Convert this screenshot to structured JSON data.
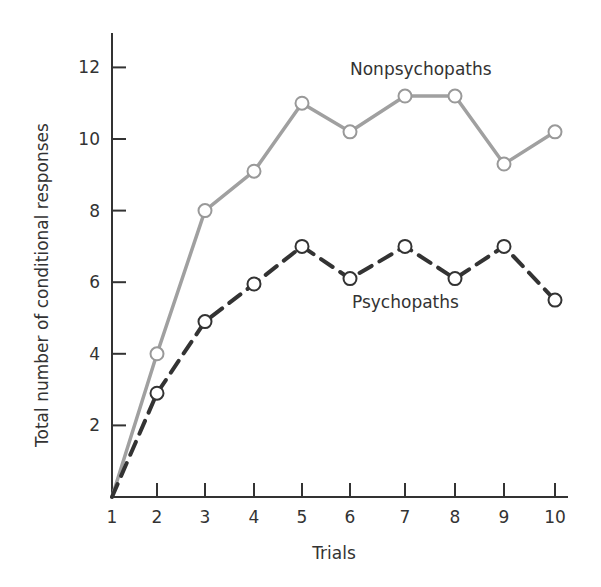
{
  "chart_data": {
    "type": "line",
    "title": "",
    "xlabel": "Trials",
    "ylabel": "Total number of conditional responses",
    "x": [
      1,
      2,
      3,
      4,
      5,
      6,
      7,
      8,
      9,
      10
    ],
    "xticks": [
      "1",
      "2",
      "3",
      "4",
      "5",
      "6",
      "7",
      "8",
      "9",
      "10"
    ],
    "yticks": [
      "2",
      "4",
      "6",
      "8",
      "10",
      "12"
    ],
    "ytick_values": [
      2,
      4,
      6,
      8,
      10,
      12
    ],
    "xlim": [
      1,
      10.3
    ],
    "ylim": [
      0,
      13
    ],
    "grid": false,
    "legend_position": "inline labels",
    "series": [
      {
        "name": "Nonpsychopaths",
        "style": "solid",
        "color": "#a0a0a0",
        "values": [
          0,
          4.0,
          8.0,
          9.1,
          11.0,
          10.2,
          11.2,
          11.2,
          9.3,
          10.2
        ]
      },
      {
        "name": "Psychopaths",
        "style": "dashed",
        "color": "#333333",
        "values": [
          0,
          2.9,
          4.9,
          5.95,
          7.0,
          6.1,
          7.0,
          6.1,
          7.0,
          5.5
        ]
      }
    ],
    "annotations": [
      {
        "text": "Nonpsychopaths",
        "near_series": "Nonpsychopaths"
      },
      {
        "text": "Psychopaths",
        "near_series": "Psychopaths"
      }
    ]
  }
}
